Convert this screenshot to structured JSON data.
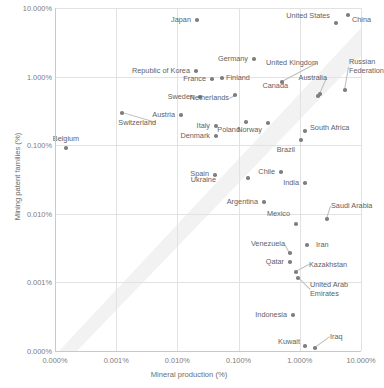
{
  "chart_data": {
    "type": "scatter",
    "title": "",
    "xlabel": "Mineral production (%)",
    "ylabel": "Mining patent families (%)",
    "xtick_labels": [
      "0.000%",
      "0.001%",
      "0.010%",
      "0.100%",
      "1.000%",
      "10.000%"
    ],
    "ytick_labels": [
      "10.000%",
      "1.000%",
      "0.100%",
      "0.010%",
      "0.001%",
      "0.000%"
    ],
    "xscale": "log-with-zero",
    "yscale": "log-with-zero",
    "grid": true,
    "legend": "none",
    "points": [
      {
        "label": "Japan",
        "x": 0.03,
        "y": 20.0,
        "px": 197,
        "py": 20,
        "lx": 191,
        "ly": 20,
        "anchor": "left"
      },
      {
        "label": "United States",
        "x": 2.8,
        "y": 17.5,
        "px": 336,
        "py": 23,
        "lx": 330,
        "ly": 16,
        "anchor": "left"
      },
      {
        "label": "China",
        "x": 5.6,
        "y": 23.0,
        "px": 348,
        "py": 15,
        "lx": 352,
        "ly": 20,
        "anchor": "right"
      },
      {
        "label": "Germany",
        "x": 0.09,
        "y": 3.2,
        "px": 254,
        "py": 59,
        "lx": 248,
        "ly": 59,
        "anchor": "left"
      },
      {
        "label": "United Kingdom",
        "x": 0.48,
        "y": 1.9,
        "px": 282,
        "py": 82,
        "lx": 318,
        "ly": 63,
        "anchor": "left",
        "leader": true
      },
      {
        "label": "Russian\nFederation",
        "x": 2.6,
        "y": 1.55,
        "px": 345,
        "py": 90,
        "lx": 349,
        "ly": 67,
        "anchor": "right",
        "leader": true
      },
      {
        "label": "Republic of Korea",
        "x": 0.028,
        "y": 2.3,
        "px": 196,
        "py": 71,
        "lx": 190,
        "ly": 71,
        "anchor": "left"
      },
      {
        "label": "France",
        "x": 0.043,
        "y": 1.7,
        "px": 212,
        "py": 79,
        "lx": 206,
        "ly": 79,
        "anchor": "left"
      },
      {
        "label": "Finland",
        "x": 0.062,
        "y": 1.72,
        "px": 222,
        "py": 78,
        "lx": 226,
        "ly": 78,
        "anchor": "right"
      },
      {
        "label": "Australia",
        "x": 1.9,
        "y": 1.2,
        "px": 320,
        "py": 94,
        "lx": 327,
        "ly": 78,
        "anchor": "left",
        "leader": true
      },
      {
        "label": "Canada",
        "x": 1.6,
        "y": 1.15,
        "px": 318,
        "py": 96,
        "lx": 288,
        "ly": 86,
        "anchor": "left"
      },
      {
        "label": "Sweden",
        "x": 0.038,
        "y": 1.05,
        "px": 200,
        "py": 97,
        "lx": 194,
        "ly": 97,
        "anchor": "left"
      },
      {
        "label": "Netherlands",
        "x": 0.05,
        "y": 1.08,
        "px": 235,
        "py": 95,
        "lx": 229,
        "ly": 98,
        "anchor": "left",
        "leader": true
      },
      {
        "label": "Austria",
        "x": 0.021,
        "y": 0.72,
        "px": 181,
        "py": 115,
        "lx": 175,
        "ly": 115,
        "anchor": "left"
      },
      {
        "label": "Switzerland",
        "x": 0.0065,
        "y": 0.8,
        "px": 122,
        "py": 113,
        "lx": 156,
        "ly": 123,
        "anchor": "left",
        "leader": true
      },
      {
        "label": "Poland",
        "x": 0.12,
        "y": 0.52,
        "px": 246,
        "py": 122,
        "lx": 240,
        "ly": 130,
        "anchor": "left"
      },
      {
        "label": "Norway",
        "x": 0.29,
        "y": 0.5,
        "px": 268,
        "py": 123,
        "lx": 262,
        "ly": 130,
        "anchor": "left"
      },
      {
        "label": "South Africa",
        "x": 1.1,
        "y": 0.36,
        "px": 305,
        "py": 131,
        "lx": 310,
        "ly": 128,
        "anchor": "right"
      },
      {
        "label": "Italy",
        "x": 0.026,
        "y": 0.45,
        "px": 216,
        "py": 126,
        "lx": 210,
        "ly": 126,
        "anchor": "left"
      },
      {
        "label": "Denmark",
        "x": 0.026,
        "y": 0.33,
        "px": 216,
        "py": 136,
        "lx": 210,
        "ly": 136,
        "anchor": "left"
      },
      {
        "label": "Brazil",
        "x": 0.82,
        "y": 0.22,
        "px": 301,
        "py": 140,
        "lx": 295,
        "ly": 150,
        "anchor": "left"
      },
      {
        "label": "Belgium",
        "x": 0.0011,
        "y": 0.145,
        "px": 66,
        "py": 148,
        "lx": 66,
        "ly": 139,
        "anchor": "center"
      },
      {
        "label": "Spain",
        "x": 0.031,
        "y": 0.055,
        "px": 215,
        "py": 175,
        "lx": 209,
        "ly": 174,
        "anchor": "left"
      },
      {
        "label": "Ukraine",
        "x": 0.078,
        "y": 0.048,
        "px": 248,
        "py": 178,
        "lx": 216,
        "ly": 180,
        "anchor": "left"
      },
      {
        "label": "Chile",
        "x": 0.3,
        "y": 0.06,
        "px": 281,
        "py": 172,
        "lx": 275,
        "ly": 172,
        "anchor": "left"
      },
      {
        "label": "India",
        "x": 0.72,
        "y": 0.042,
        "px": 305,
        "py": 183,
        "lx": 299,
        "ly": 183,
        "anchor": "left"
      },
      {
        "label": "Argentina",
        "x": 0.12,
        "y": 0.022,
        "px": 264,
        "py": 202,
        "lx": 258,
        "ly": 202,
        "anchor": "left"
      },
      {
        "label": "Mexico",
        "x": 0.42,
        "y": 0.015,
        "px": 296,
        "py": 224,
        "lx": 290,
        "ly": 214,
        "anchor": "left"
      },
      {
        "label": "Saudi Arabia",
        "x": 1.3,
        "y": 0.016,
        "px": 327,
        "py": 219,
        "lx": 331,
        "ly": 206,
        "anchor": "right",
        "leader": true
      },
      {
        "label": "Venezuela",
        "x": 0.33,
        "y": 0.006,
        "px": 290,
        "py": 253,
        "lx": 285,
        "ly": 244,
        "anchor": "left",
        "leader": true
      },
      {
        "label": "Iran",
        "x": 0.6,
        "y": 0.0072,
        "px": 307,
        "py": 245,
        "lx": 316,
        "ly": 245,
        "anchor": "right"
      },
      {
        "label": "Qatar",
        "x": 0.33,
        "y": 0.0042,
        "px": 290,
        "py": 262,
        "lx": 284,
        "ly": 262,
        "anchor": "left"
      },
      {
        "label": "Kazakhstan",
        "x": 0.48,
        "y": 0.003,
        "px": 296,
        "py": 272,
        "lx": 309,
        "ly": 265,
        "anchor": "right",
        "leader": true
      },
      {
        "label": "United Arab\nEmirates",
        "x": 0.51,
        "y": 0.0024,
        "px": 298,
        "py": 278,
        "lx": 310,
        "ly": 290,
        "anchor": "right",
        "leader": true
      },
      {
        "label": "Indonesia",
        "x": 0.38,
        "y": 0.0006,
        "px": 293,
        "py": 315,
        "lx": 287,
        "ly": 315,
        "anchor": "left"
      },
      {
        "label": "Kuwait",
        "x": 0.9,
        "y": 0.00012,
        "px": 305,
        "py": 346,
        "lx": 300,
        "ly": 342,
        "anchor": "left"
      },
      {
        "label": "Iraq",
        "x": 1.6,
        "y": 0.0001,
        "px": 315,
        "py": 348,
        "lx": 330,
        "ly": 337,
        "anchor": "right",
        "leader": true
      }
    ]
  },
  "style": {
    "dot_color": "#7f7f7f",
    "grid_color": "#e2e2e2",
    "axis_color": "#c9c9c9",
    "label_color": "#5f5f5f",
    "tick_color": "#7d7d7d",
    "band_color": "#ededed"
  }
}
